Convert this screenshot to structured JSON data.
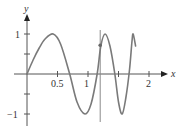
{
  "chart_data": {
    "type": "line",
    "title": "",
    "xlabel": "x",
    "ylabel": "y",
    "xlim": [
      0,
      2.1
    ],
    "ylim": [
      -1.2,
      1.3
    ],
    "x_ticks": [
      0.5,
      1,
      1.5,
      2
    ],
    "x_tick_labels": [
      "0.5",
      "1",
      "",
      "2"
    ],
    "y_ticks": [
      1,
      0.5,
      -0.5,
      -1
    ],
    "y_tick_labels": [
      "1",
      "",
      "",
      "−1"
    ],
    "grid": false,
    "series": [
      {
        "name": "curve",
        "color": "#7a7a7a",
        "x": [
          0,
          0.1,
          0.2,
          0.3,
          0.43,
          0.55,
          0.7,
          0.82,
          0.95,
          1.05,
          1.15,
          1.21,
          1.28,
          1.36,
          1.44,
          1.5,
          1.56,
          1.62,
          1.68,
          1.72,
          1.74,
          1.78
        ],
        "y": [
          0,
          0.35,
          0.65,
          0.88,
          1.0,
          0.75,
          0.0,
          -0.7,
          -1.0,
          -0.75,
          0.0,
          0.7,
          1.0,
          0.7,
          0.0,
          -0.7,
          -1.0,
          -0.6,
          0.1,
          0.8,
          1.0,
          0.7
        ]
      }
    ],
    "annotations": [
      {
        "type": "vline",
        "x": 1.2,
        "y_from": -1.2,
        "y_to": 1.1,
        "color": "#8a8a8a"
      },
      {
        "type": "point",
        "x": 1.2,
        "y": 0.72,
        "color": "#666666"
      }
    ]
  },
  "axes": {
    "x_label": "x",
    "y_label": "y",
    "tick_labels": {
      "x_05": "0.5",
      "x_1": "1",
      "x_2": "2",
      "y_1": "1",
      "y_m1": "−1"
    }
  }
}
